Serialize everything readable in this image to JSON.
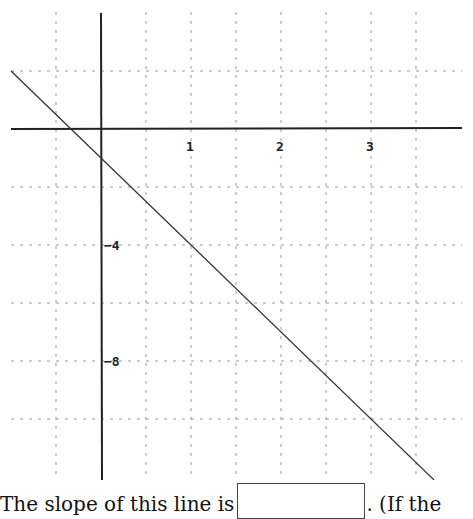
{
  "chart_data": {
    "type": "line",
    "title": "",
    "xlabel": "",
    "ylabel": "",
    "x_tick_labels": [
      "1",
      "2",
      "3"
    ],
    "y_tick_labels": [
      "-4",
      "-8"
    ],
    "xlim": [
      -1.0,
      3.7
    ],
    "ylim": [
      -11.7,
      2.0
    ],
    "grid": true,
    "grid_style": "dashed",
    "grid_x_step": 0.5,
    "grid_y_step": 2,
    "series": [
      {
        "name": "line",
        "equation": "y = -3x - 1",
        "x": [
          -1.0,
          3.7
        ],
        "y": [
          2.0,
          -12.1
        ]
      }
    ],
    "colors": {
      "axis": "#222222",
      "grid": "#9a9a9a",
      "line": "#333333"
    }
  },
  "question": {
    "prefix": "The slope of this line is",
    "answer_value": "",
    "suffix": ". (If the"
  }
}
